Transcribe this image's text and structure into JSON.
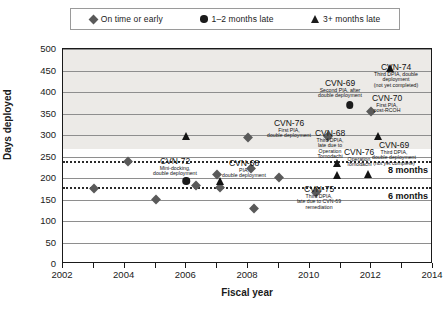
{
  "chart_data": {
    "type": "scatter",
    "title": "",
    "xlabel": "Fiscal year",
    "ylabel": "Days deployed",
    "xlim": [
      2002,
      2014
    ],
    "ylim": [
      0,
      500
    ],
    "ytick_step": 50,
    "xtick_step": 1,
    "xtick_labels": [
      "2002",
      "2004",
      "2006",
      "2008",
      "2010",
      "2012",
      "2014"
    ],
    "ytick_labels": [
      "0",
      "50",
      "100",
      "150",
      "200",
      "250",
      "300",
      "350",
      "400",
      "450",
      "500"
    ],
    "grid": true,
    "legend_position": "top",
    "legend": [
      {
        "key": "on-time",
        "label": "On time or early",
        "marker": "diamond",
        "color": "#5a5a5a"
      },
      {
        "key": "late-1-2",
        "label": "1–2 months late",
        "marker": "circle",
        "color": "#1c1c1c"
      },
      {
        "key": "late-3plus",
        "label": "3+ months late",
        "marker": "triangle",
        "color": "#1c1c1c"
      }
    ],
    "reference_lines": [
      {
        "label": "8 months",
        "value": 240,
        "style": "dotted"
      },
      {
        "label": "6 months",
        "value": 180,
        "style": "dotted"
      }
    ],
    "series": [
      {
        "name": "On time or early",
        "marker": "diamond",
        "points": [
          {
            "x": 2003.0,
            "y": 178
          },
          {
            "x": 2004.1,
            "y": 243
          },
          {
            "x": 2005.0,
            "y": 153
          },
          {
            "x": 2006.3,
            "y": 185
          },
          {
            "x": 2007.0,
            "y": 212
          },
          {
            "x": 2007.1,
            "y": 182
          },
          {
            "x": 2008.0,
            "y": 298
          },
          {
            "x": 2008.1,
            "y": 225
          },
          {
            "x": 2008.2,
            "y": 133
          },
          {
            "x": 2009.0,
            "y": 205
          },
          {
            "x": 2010.2,
            "y": 170
          },
          {
            "x": 2010.6,
            "y": 300
          },
          {
            "x": 2012.0,
            "y": 358
          }
        ]
      },
      {
        "name": "1–2 months late",
        "marker": "circle",
        "points": [
          {
            "x": 2006.0,
            "y": 196
          },
          {
            "x": 2011.3,
            "y": 373
          }
        ]
      },
      {
        "name": "3+ months late",
        "marker": "triangle",
        "points": [
          {
            "x": 2006.0,
            "y": 300
          },
          {
            "x": 2007.1,
            "y": 196
          },
          {
            "x": 2010.9,
            "y": 238
          },
          {
            "x": 2010.9,
            "y": 210
          },
          {
            "x": 2011.9,
            "y": 212
          },
          {
            "x": 2012.2,
            "y": 300
          },
          {
            "x": 2012.6,
            "y": 458
          }
        ]
      }
    ],
    "annotations": [
      {
        "id": "cvn-72",
        "title": "CVN-72",
        "subtitle": [
          "Mini-docking,",
          "double deployment"
        ],
        "x": 174,
        "y": 156
      },
      {
        "id": "cvn-68-pia",
        "title": "CVN-68",
        "subtitle": [
          "PIA,",
          "double deployment"
        ],
        "x": 243,
        "y": 158
      },
      {
        "id": "cvn-76-first-pia",
        "title": "CVN-76",
        "subtitle": [
          "First PIA,",
          "double deployment"
        ],
        "x": 288,
        "y": 118
      },
      {
        "id": "cvn-68-third-dpia",
        "title": "CVN-68",
        "subtitle": [
          "Third DPIA,",
          "late due to",
          "Operation",
          "Tomodachi"
        ],
        "x": 329,
        "y": 128
      },
      {
        "id": "cvn-69-second-pia",
        "title": "CVN-69",
        "subtitle": [
          "Second PIA, after",
          "double deployment"
        ],
        "x": 339,
        "y": 78
      },
      {
        "id": "cvn-70",
        "title": "CVN-70",
        "subtitle": [
          "First PIA,",
          "post-RCOH"
        ],
        "x": 386,
        "y": 93
      },
      {
        "id": "cvn-74",
        "title": "CVN-74",
        "subtitle": [
          "Third DPIA, double",
          "deployment",
          "(not yet completed)"
        ],
        "x": 395,
        "y": 62
      },
      {
        "id": "cvn-69-third-dpia",
        "title": "CVN-69",
        "subtitle": [
          "Third DPIA,",
          "double deployment",
          "(not yet complete)"
        ],
        "x": 393,
        "y": 140
      },
      {
        "id": "cvn-76-tomodachi",
        "title": "CVN-76",
        "subtitle": [
          "Operation",
          "Tomodachi"
        ],
        "x": 358,
        "y": 147
      },
      {
        "id": "cvn-75",
        "title": "CVN-75",
        "subtitle": [
          "Third DPIA,",
          "late due to CVN-69",
          "remediation"
        ],
        "x": 318,
        "y": 184
      }
    ]
  }
}
